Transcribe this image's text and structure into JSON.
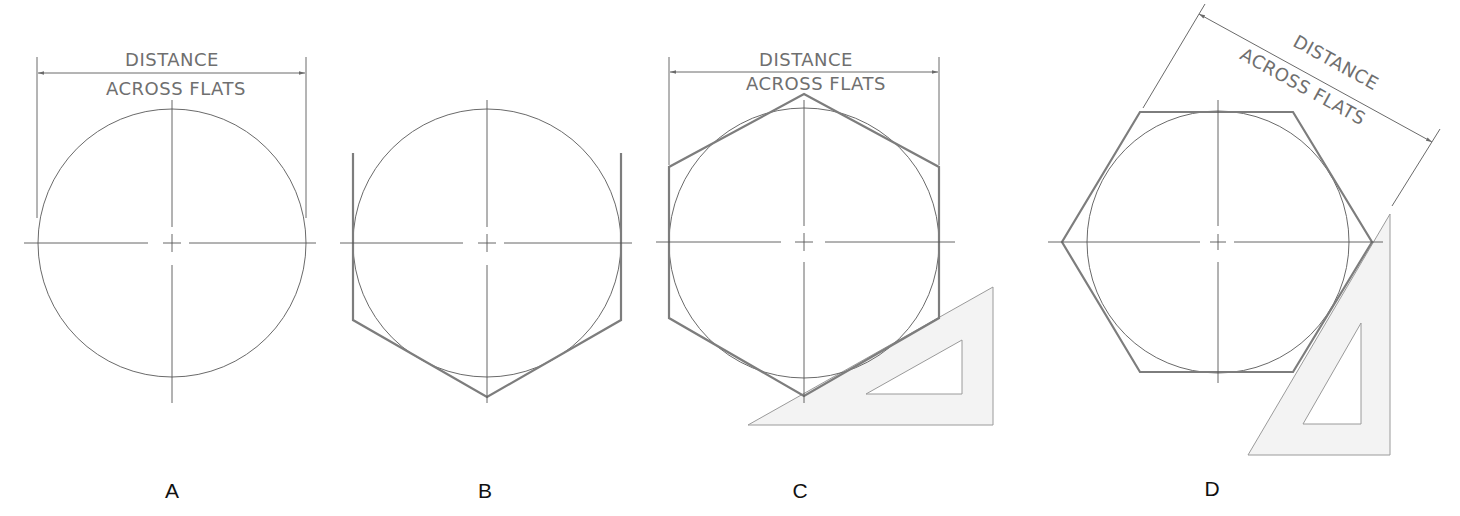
{
  "figure": {
    "dimension_label_line1": "DISTANCE",
    "dimension_label_line2": "ACROSS FLATS",
    "panels": [
      {
        "id": "A",
        "label": "A",
        "description": "Circle with centerlines and distance-across-flats dimension"
      },
      {
        "id": "B",
        "label": "B",
        "description": "Vertical flats and lower sides drawn tangent to circle"
      },
      {
        "id": "C",
        "label": "C",
        "description": "Completed hexagon using 30-60 triangle, dimensioned"
      },
      {
        "id": "D",
        "label": "D",
        "description": "Hexagon rotated with flats dimension at angle, triangle guide"
      }
    ],
    "colors": {
      "line": "#7d7d7d",
      "triangle_fill": "#f3f3f3",
      "text": "#6f6f6f"
    }
  }
}
